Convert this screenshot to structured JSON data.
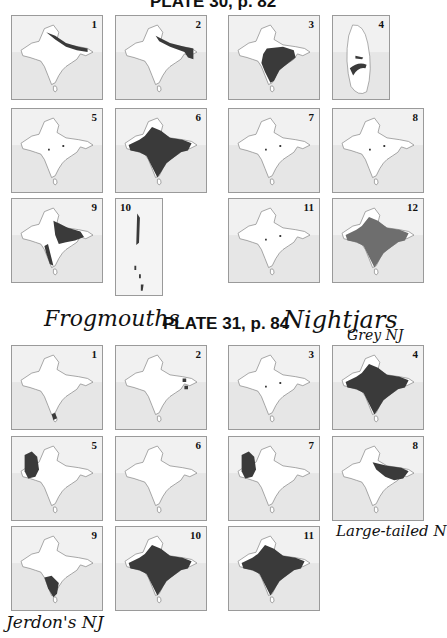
{
  "plate30": {
    "title": "PLATE 30, p. 82",
    "maps": [
      {
        "n": "1",
        "range": "himalaya-thin"
      },
      {
        "n": "2",
        "range": "himalaya-ne"
      },
      {
        "n": "3",
        "range": "central-peninsula"
      },
      {
        "n": "4",
        "range": "sri-lanka-only"
      },
      {
        "n": "5",
        "range": "spots"
      },
      {
        "n": "6",
        "range": "whole-subcontinent"
      },
      {
        "n": "7",
        "range": "spots"
      },
      {
        "n": "8",
        "range": "spots"
      },
      {
        "n": "9",
        "range": "himalaya-ghats"
      },
      {
        "n": "10",
        "range": "andaman-islands"
      },
      {
        "n": "11",
        "range": "spots"
      },
      {
        "n": "12",
        "range": "whole-grey"
      }
    ]
  },
  "plate31": {
    "title": "PLATE 31, p. 84",
    "maps": [
      {
        "n": "1",
        "range": "south-tip"
      },
      {
        "n": "2",
        "range": "ne-spots"
      },
      {
        "n": "3",
        "range": "spots"
      },
      {
        "n": "4",
        "range": "whole-subcontinent"
      },
      {
        "n": "5",
        "range": "northwest"
      },
      {
        "n": "6",
        "range": "none"
      },
      {
        "n": "7",
        "range": "northwest"
      },
      {
        "n": "8",
        "range": "gangetic-plain"
      },
      {
        "n": "9",
        "range": "south-west"
      },
      {
        "n": "10",
        "range": "whole-subcontinent"
      },
      {
        "n": "11",
        "range": "whole-subcontinent"
      }
    ]
  },
  "annotations": {
    "frogmouths": "Frogmouths",
    "nightjars": "Nightjars",
    "grey_nj": "Grey NJ",
    "large_tailed": "Large-tailed N",
    "jerdons_nj": "Jerdon's NJ"
  },
  "colors": {
    "range_fill": "#3a3a3a",
    "range_grey": "#6e6e6e",
    "sea": "#e6e6e6",
    "land": "#ffffff",
    "outline": "#777777"
  }
}
